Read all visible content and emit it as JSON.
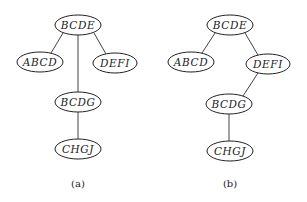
{
  "diagrams": [
    {
      "id": "a",
      "caption": "(a)",
      "caption_pos": [
        78,
        187
      ],
      "nodes": [
        {
          "id": "BCDE",
          "label": "BCDE",
          "cx": 78,
          "cy": 25,
          "rx": 23,
          "ry": 10
        },
        {
          "id": "ABCD",
          "label": "ABCD",
          "cx": 40,
          "cy": 62,
          "rx": 23,
          "ry": 10
        },
        {
          "id": "DEFI",
          "label": "DEFI",
          "cx": 115,
          "cy": 63,
          "rx": 22,
          "ry": 10
        },
        {
          "id": "BCDG",
          "label": "BCDG",
          "cx": 78,
          "cy": 102,
          "rx": 23,
          "ry": 10
        },
        {
          "id": "CHGJ",
          "label": "CHGJ",
          "cx": 78,
          "cy": 149,
          "rx": 23,
          "ry": 10
        }
      ],
      "edges": [
        {
          "from": "BCDE",
          "to": "ABCD",
          "x1": 63,
          "y1": 33,
          "x2": 51,
          "y2": 53
        },
        {
          "from": "BCDE",
          "to": "DEFI",
          "x1": 94,
          "y1": 33,
          "x2": 106,
          "y2": 54
        },
        {
          "from": "BCDE",
          "to": "BCDG",
          "x1": 78,
          "y1": 35,
          "x2": 78,
          "y2": 92
        },
        {
          "from": "BCDG",
          "to": "CHGJ",
          "x1": 78,
          "y1": 112,
          "x2": 78,
          "y2": 139
        }
      ]
    },
    {
      "id": "b",
      "caption": "(b)",
      "caption_pos": [
        230,
        187
      ],
      "nodes": [
        {
          "id": "BCDE",
          "label": "BCDE",
          "cx": 230,
          "cy": 25,
          "rx": 23,
          "ry": 10
        },
        {
          "id": "ABCD",
          "label": "ABCD",
          "cx": 191,
          "cy": 62,
          "rx": 23,
          "ry": 10
        },
        {
          "id": "DEFI",
          "label": "DEFI",
          "cx": 268,
          "cy": 64,
          "rx": 22,
          "ry": 10
        },
        {
          "id": "BCDG",
          "label": "BCDG",
          "cx": 229,
          "cy": 104,
          "rx": 23,
          "ry": 10
        },
        {
          "id": "CHGJ",
          "label": "CHGJ",
          "cx": 230,
          "cy": 151,
          "rx": 23,
          "ry": 10
        }
      ],
      "edges": [
        {
          "from": "BCDE",
          "to": "ABCD",
          "x1": 215,
          "y1": 33,
          "x2": 202,
          "y2": 53
        },
        {
          "from": "BCDE",
          "to": "DEFI",
          "x1": 245,
          "y1": 33,
          "x2": 258,
          "y2": 55
        },
        {
          "from": "DEFI",
          "to": "BCDG",
          "x1": 258,
          "y1": 73,
          "x2": 243,
          "y2": 96
        },
        {
          "from": "BCDG",
          "to": "CHGJ",
          "x1": 229,
          "y1": 114,
          "x2": 229,
          "y2": 141
        }
      ]
    }
  ]
}
